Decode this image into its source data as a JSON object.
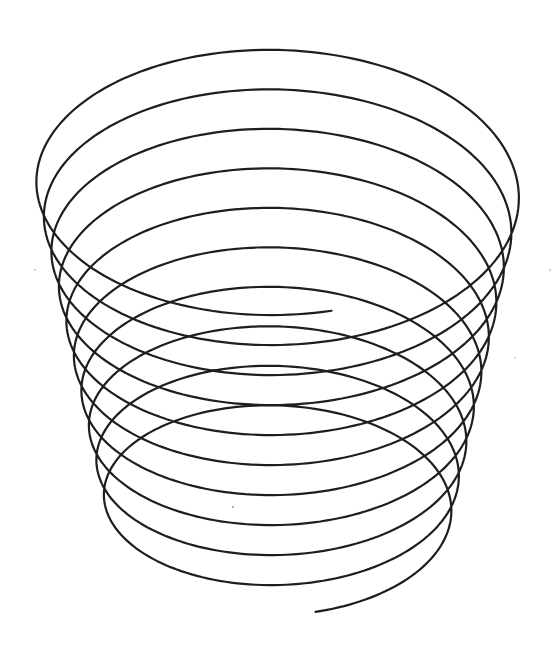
{
  "figure": {
    "background_color": "#ffffff",
    "stroke_color": "#1e1e1e",
    "stroke_width": 2.2
  },
  "helix": {
    "turns_visible": 10,
    "center_x": 279.5,
    "top": {
      "radius_x": 245,
      "back_crest_y": 50,
      "front_y": 315
    },
    "per_turn": {
      "back_crest_step_y": 39.5,
      "front_step_y": 30,
      "radius_x_step": -7.5
    },
    "start_point": {
      "x": 330,
      "y": 315
    },
    "end_point": {
      "x": 315,
      "y": 613
    },
    "u_start": -0.034,
    "u_end": 9.966,
    "samples_per_turn": 180
  },
  "specks": [
    {
      "x": 35,
      "y": 270,
      "r": 0.8
    },
    {
      "x": 550,
      "y": 270,
      "r": 0.8
    },
    {
      "x": 233,
      "y": 507,
      "r": 1.0
    },
    {
      "x": 515,
      "y": 358,
      "r": 0.7
    }
  ]
}
